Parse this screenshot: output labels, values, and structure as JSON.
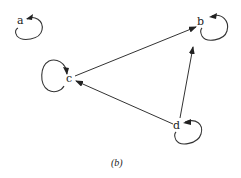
{
  "graph": {
    "nodes": [
      {
        "id": "a",
        "label": "a",
        "x": 20,
        "y": 21
      },
      {
        "id": "b",
        "label": "b",
        "x": 200,
        "y": 22
      },
      {
        "id": "c",
        "label": "c",
        "x": 69,
        "y": 79
      },
      {
        "id": "d",
        "label": "d",
        "x": 176,
        "y": 126
      }
    ],
    "edges": [
      {
        "from": "c",
        "to": "b",
        "directed": true
      },
      {
        "from": "d",
        "to": "b",
        "directed": true
      },
      {
        "from": "d",
        "to": "c",
        "directed": true
      }
    ],
    "self_loops": [
      "a",
      "b",
      "c",
      "d"
    ]
  },
  "caption": "(b)"
}
